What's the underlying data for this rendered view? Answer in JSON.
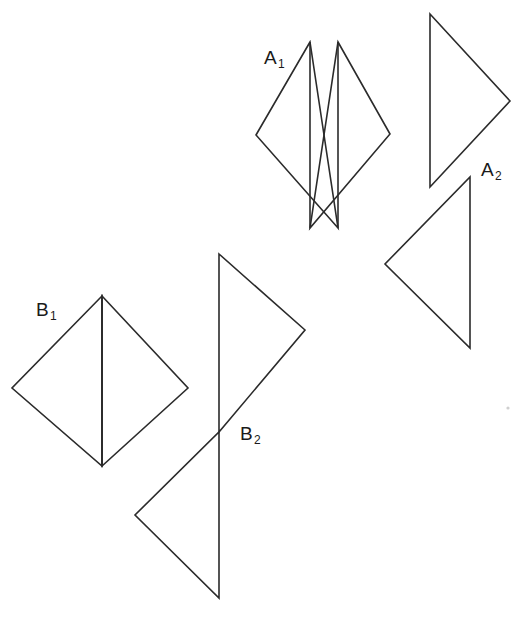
{
  "figure": {
    "width": 532,
    "height": 620,
    "background_color": "#ffffff",
    "stroke_color": "#2b2b2b",
    "stroke_width": 1.6,
    "labels": {
      "a1": {
        "base": "A",
        "sub": "1"
      },
      "a2": {
        "base": "A",
        "sub": "2"
      },
      "b1": {
        "base": "B",
        "sub": "1"
      },
      "b2": {
        "base": "B",
        "sub": "2"
      }
    },
    "shapes": {
      "a1_triangle_left": {
        "name": "A1 left triangle",
        "points": "310,42 256,135 338,228"
      },
      "a1_triangle_right": {
        "name": "A1 right triangle",
        "points": "338,42 390,134 310,228"
      },
      "a1_edge_left": {
        "name": "A1 left triangle vertical-ish edge",
        "points": "310,42 310,228"
      },
      "a1_edge_right": {
        "name": "A1 right triangle vertical-ish edge",
        "points": "338,42 338,228"
      },
      "a2_triangle_upper": {
        "name": "A2 upper right-pointing triangle",
        "points": "430,14 510,101 430,187"
      },
      "a2_triangle_lower": {
        "name": "A2 lower left-pointing triangle",
        "points": "470,177 470,348 385,264"
      },
      "b1_triangle_left": {
        "name": "B1 left triangle",
        "points": "102,296 12,388 102,466"
      },
      "b1_triangle_right": {
        "name": "B1 right triangle",
        "points": "102,296 188,388 102,466"
      },
      "b1_divider": {
        "name": "B1 shared vertical edge",
        "points": "102,296 102,466"
      },
      "b2_triangle_upper": {
        "name": "B2 upper right-pointing triangle",
        "points": "219,254 305,330 219,432"
      },
      "b2_triangle_lower": {
        "name": "B2 lower left-pointing triangle",
        "points": "219,432 219,598 135,515"
      },
      "speck": {
        "name": "faint speck",
        "cx": 508,
        "cy": 408,
        "r": 1.6
      }
    }
  }
}
